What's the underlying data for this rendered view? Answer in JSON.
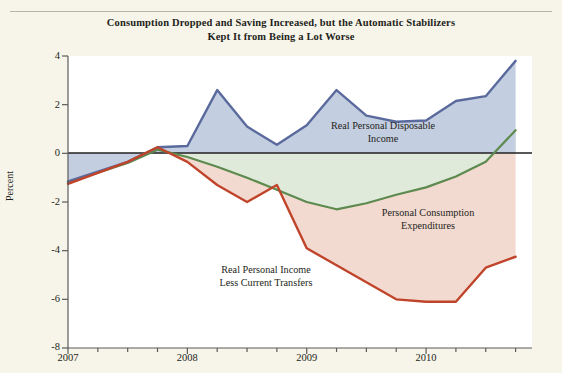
{
  "figure": {
    "title_line1": "Consumption Dropped and Saving Increased, but the Automatic Stabilizers",
    "title_line2": "Kept It from Being a Lot Worse",
    "background_color": "#f7f4e9"
  },
  "chart_data": {
    "type": "line",
    "title": "Consumption Dropped and Saving Increased, but the Automatic Stabilizers Kept It from Being a Lot Worse",
    "xlabel": "",
    "ylabel": "Percent",
    "xlim": [
      "2007Q1",
      "2010Q4"
    ],
    "ylim": [
      -8,
      4
    ],
    "yticks": [
      4,
      2,
      0,
      -2,
      -4,
      -6,
      -8
    ],
    "xticks": [
      "2007",
      "2008",
      "2009",
      "2010"
    ],
    "xtick_all": [
      "2007Q1",
      "2007Q2",
      "2007Q3",
      "2007Q4",
      "2008Q1",
      "2008Q2",
      "2008Q3",
      "2008Q4",
      "2009Q1",
      "2009Q2",
      "2009Q3",
      "2009Q4",
      "2010Q1",
      "2010Q2",
      "2010Q3",
      "2010Q4"
    ],
    "grid": false,
    "legend_position": "inline-annotations",
    "zero_line": true,
    "x": [
      "2007Q1",
      "2007Q2",
      "2007Q3",
      "2007Q4",
      "2008Q1",
      "2008Q2",
      "2008Q3",
      "2008Q4",
      "2009Q1",
      "2009Q2",
      "2009Q3",
      "2009Q4",
      "2010Q1",
      "2010Q2",
      "2010Q3",
      "2010Q4"
    ],
    "series": [
      {
        "name": "Real Personal Disposable Income",
        "color": "#5a6a9c",
        "fill": "#c3cde0",
        "values": [
          -1.15,
          -0.75,
          -0.35,
          0.25,
          0.3,
          2.6,
          1.1,
          0.35,
          1.15,
          2.6,
          1.55,
          1.3,
          1.35,
          2.15,
          2.35,
          3.8
        ]
      },
      {
        "name": "Personal Consumption Expenditures",
        "color": "#5d8a4e",
        "fill": "#dfe9d8",
        "values": [
          -1.2,
          -0.8,
          -0.4,
          0.15,
          -0.15,
          -0.55,
          -1.0,
          -1.5,
          -2.0,
          -2.3,
          -2.05,
          -1.7,
          -1.4,
          -0.95,
          -0.35,
          0.95
        ]
      },
      {
        "name": "Real Personal Income Less Current Transfers",
        "color": "#c0442a",
        "fill": "#f2dad2",
        "values": [
          -1.25,
          -0.8,
          -0.35,
          0.25,
          -0.35,
          -1.3,
          -2.0,
          -1.3,
          -3.9,
          -4.6,
          -5.3,
          -6.0,
          -6.1,
          -6.1,
          -4.7,
          -4.25
        ]
      }
    ],
    "annotations": [
      {
        "text": "Real Personal Disposable\nIncome",
        "series": "Real Personal Disposable Income"
      },
      {
        "text": "Personal Consumption\nExpenditures",
        "series": "Personal Consumption Expenditures"
      },
      {
        "text": "Real Personal Income\nLess Current Transfers",
        "series": "Real Personal Income Less Current Transfers"
      }
    ]
  },
  "axes": {
    "y_label": "Percent",
    "y_ticks": [
      "4",
      "2",
      "0",
      "-2",
      "-4",
      "-6",
      "-8"
    ],
    "x_ticks": [
      "2007",
      "2008",
      "2009",
      "2010"
    ]
  }
}
